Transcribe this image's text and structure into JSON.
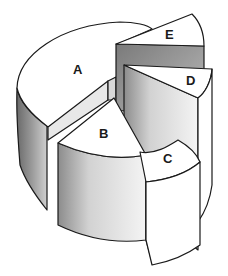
{
  "diagram": {
    "type": "exploded-3d-pie",
    "slices": [
      {
        "id": "A",
        "label": "A"
      },
      {
        "id": "B",
        "label": "B"
      },
      {
        "id": "C",
        "label": "C"
      },
      {
        "id": "D",
        "label": "D"
      },
      {
        "id": "E",
        "label": "E"
      }
    ]
  }
}
